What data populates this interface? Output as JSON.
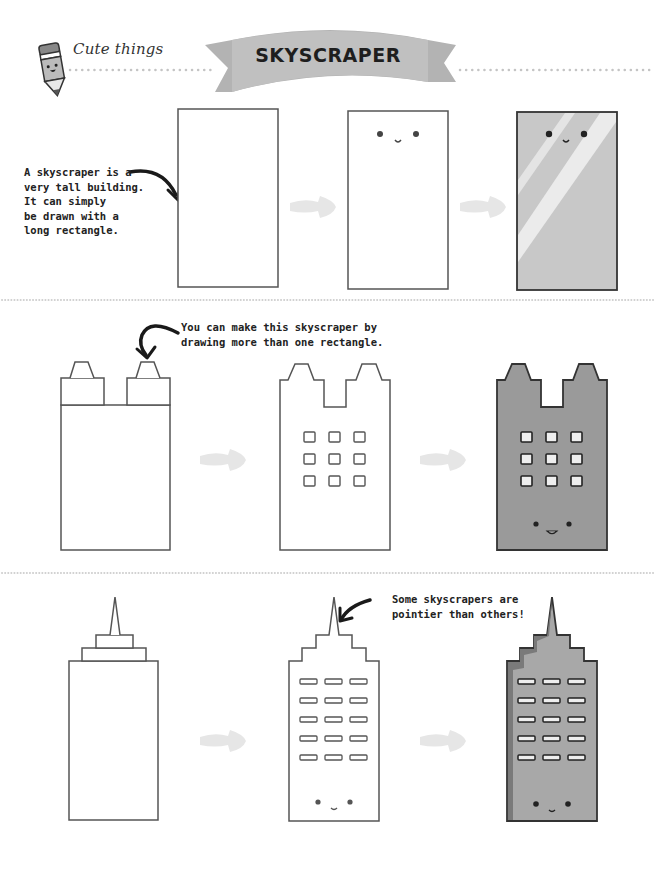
{
  "header": {
    "section_label": "Cute things",
    "title": "SKYSCRAPER",
    "icon": "pencil-mascot-icon"
  },
  "colors": {
    "banner": "#b3b3b3",
    "outline": "#555555",
    "building_fill": "#9a9a9a",
    "glass_fill": "#c8c8c8",
    "arrow_fill": "#e6e6e6",
    "window_fill": "#eeeeee",
    "dots": "#c4c4c4"
  },
  "rows": [
    {
      "caption": [
        "A skyscraper is a",
        "very tall building.",
        "It can simply",
        "be drawn with a",
        "long rectangle."
      ],
      "steps": [
        "plain-rectangle",
        "rectangle-with-face",
        "colored-glass-building"
      ]
    },
    {
      "caption": [
        "You can make this skyscraper by",
        "drawing more than one rectangle."
      ],
      "steps": [
        "stacked-rectangles",
        "outlined-building-with-windows",
        "colored-building-with-face"
      ],
      "window_grid": {
        "rows": 3,
        "cols": 3
      }
    },
    {
      "caption": [
        "Some skyscrapers are",
        "pointier than others!"
      ],
      "steps": [
        "tiered-spire-rectangles",
        "outlined-spire-building",
        "colored-spire-building"
      ],
      "window_grid": {
        "rows": 5,
        "cols": 3
      }
    }
  ]
}
